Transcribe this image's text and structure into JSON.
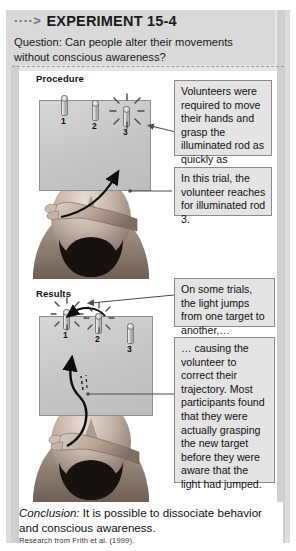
{
  "header": {
    "arrow_glyph": "····>",
    "title": "EXPERIMENT 15-4",
    "question": "Question: Can people alter their movements without conscious awareness?"
  },
  "procedure": {
    "label": "Procedure",
    "rods": [
      {
        "number": "1",
        "illuminated": false
      },
      {
        "number": "2",
        "illuminated": false
      },
      {
        "number": "3",
        "illuminated": true
      }
    ],
    "callouts": [
      {
        "id": "procedure-callout-1",
        "text": "Volunteers  were required to move their hands and grasp the illuminated rod as quickly as possible."
      },
      {
        "id": "procedure-callout-2",
        "text": "In this trial, the volunteer reaches for illuminated rod 3."
      }
    ]
  },
  "results": {
    "label": "Results",
    "rods": [
      {
        "number": "1",
        "illuminated": true
      },
      {
        "number": "2",
        "illuminated": true
      },
      {
        "number": "3",
        "illuminated": false
      }
    ],
    "callouts": [
      {
        "id": "results-callout-1",
        "text": "On some trials, the light jumps from one target to another,…"
      },
      {
        "id": "results-callout-2",
        "text": "… causing the volunteer to correct their trajectory. Most participants found that they were actually grasping the new target before they were aware that the light had jumped."
      }
    ]
  },
  "footer": {
    "conclusion_label": "Conclusion:",
    "conclusion_text": " It is possible to dissociate behavior and conscious awareness.",
    "citation": "Research from Frith et al. (1999)."
  },
  "colors": {
    "panel_gray": "#e6e6e6",
    "header_gray": "#d9d9d9",
    "callout_fill": "#e4e4e4",
    "callout_border": "#8a8a8a",
    "board_gray": "#d0d0d0",
    "text": "#111111"
  }
}
